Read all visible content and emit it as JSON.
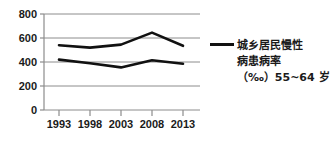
{
  "chart_data": {
    "type": "line",
    "title": "",
    "xlabel": "",
    "ylabel": "",
    "categories": [
      "1993",
      "1998",
      "2003",
      "2008",
      "2013"
    ],
    "yticks": [
      0,
      200,
      400,
      600,
      800
    ],
    "ylim": [
      0,
      800
    ],
    "grid": true,
    "legend_position": "right",
    "series": [
      {
        "name": "城乡居民慢性病患病率（‰）55~64岁 上线",
        "values": [
          540,
          520,
          545,
          645,
          535
        ],
        "color": "#111111"
      },
      {
        "name": "城乡居民慢性病患病率（‰）55~64岁 下线",
        "values": [
          420,
          390,
          355,
          415,
          385
        ],
        "color": "#111111"
      }
    ]
  },
  "axis": {
    "y_tick_labels": [
      "800",
      "600",
      "400",
      "200",
      "0"
    ],
    "x_tick_labels": [
      "1993",
      "1998",
      "2003",
      "2008",
      "2013"
    ]
  },
  "legend": {
    "line1": "城乡居民慢性",
    "line2": "病患病率",
    "line3": "（‰）55~64 岁",
    "marker_color": "#111111"
  },
  "colors": {
    "line": "#111111",
    "grid": "#8c8c8c",
    "axis": "#8c8c8c",
    "background": "#ffffff",
    "text": "#1a1a1a"
  }
}
